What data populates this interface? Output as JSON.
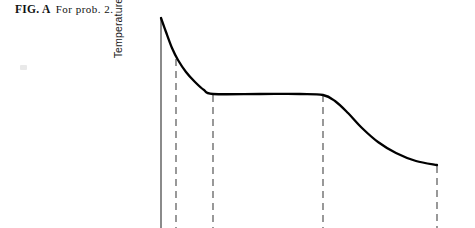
{
  "figure": {
    "label": "FIG. A",
    "caption": "For prob. 2."
  },
  "axes": {
    "ylabel": "Temperature",
    "xlabel": "",
    "y_axis_x": 161,
    "y_axis_top": 17,
    "y_axis_bottom": 228
  },
  "colors": {
    "ink": "#111111",
    "curve": "#000000",
    "dashed": "#555555",
    "background": "#ffffff",
    "speck": "#d7d7d7"
  },
  "chart_data": {
    "type": "line",
    "title": "",
    "subtitle": "",
    "xlabel": "",
    "ylabel": "Temperature",
    "grid": false,
    "legend": null,
    "xlim": [
      0,
      1
    ],
    "ylim": [
      0,
      1
    ],
    "series": [
      {
        "name": "Temperature vs time",
        "points": [
          {
            "x": 161,
            "y": 18
          },
          {
            "x": 166,
            "y": 32
          },
          {
            "x": 172,
            "y": 48
          },
          {
            "x": 178,
            "y": 60
          },
          {
            "x": 186,
            "y": 72
          },
          {
            "x": 195,
            "y": 82
          },
          {
            "x": 204,
            "y": 90
          },
          {
            "x": 213,
            "y": 94
          },
          {
            "x": 260,
            "y": 94
          },
          {
            "x": 300,
            "y": 94
          },
          {
            "x": 323,
            "y": 95
          },
          {
            "x": 335,
            "y": 101
          },
          {
            "x": 348,
            "y": 113
          },
          {
            "x": 362,
            "y": 128
          },
          {
            "x": 378,
            "y": 142
          },
          {
            "x": 396,
            "y": 153
          },
          {
            "x": 416,
            "y": 161
          },
          {
            "x": 437,
            "y": 165
          }
        ]
      }
    ],
    "dashed_markers": [
      {
        "name": "marker-1",
        "x": 176,
        "y_top": 59,
        "y_bottom": 228
      },
      {
        "name": "marker-2",
        "x": 213,
        "y_top": 95,
        "y_bottom": 228
      },
      {
        "name": "marker-3",
        "x": 323,
        "y_top": 95,
        "y_bottom": 228
      },
      {
        "name": "marker-4",
        "x": 437,
        "y_top": 166,
        "y_bottom": 228
      }
    ]
  }
}
